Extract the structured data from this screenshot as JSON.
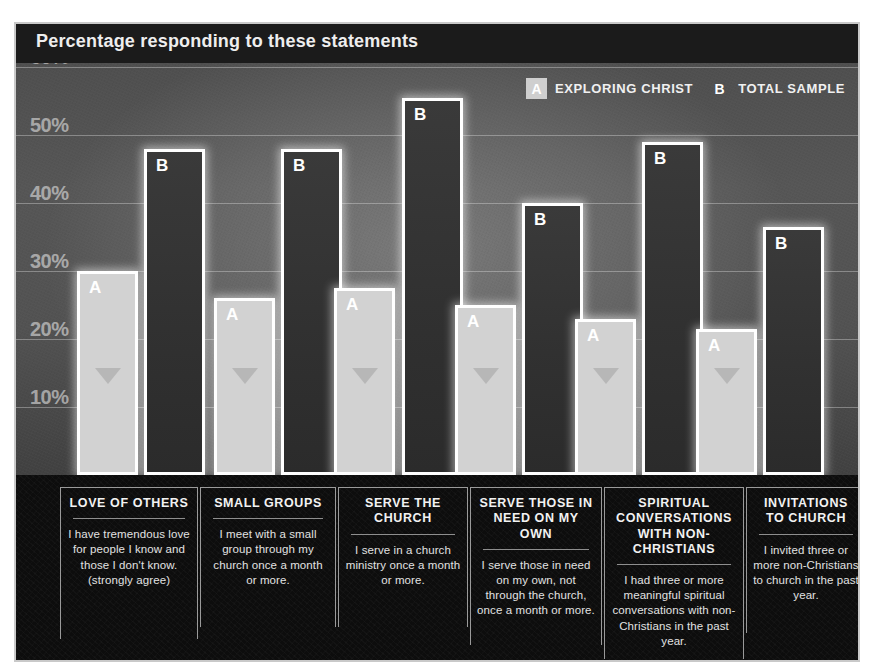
{
  "header": {
    "title": "Percentage responding to these statements"
  },
  "legend": {
    "items": [
      {
        "key": "A",
        "label": "EXPLORING CHRIST"
      },
      {
        "key": "B",
        "label": "TOTAL SAMPLE"
      }
    ]
  },
  "axis": {
    "ticks": [
      "60%",
      "50%",
      "40%",
      "30%",
      "20%",
      "10%"
    ]
  },
  "captions": [
    {
      "title": "LOVE OF OTHERS",
      "body": "I have tremendous love for people I know and those I don't know. (strongly agree)"
    },
    {
      "title": "SMALL GROUPS",
      "body": "I meet with a small group through my church once a month or more."
    },
    {
      "title": "SERVE THE CHURCH",
      "body": "I serve in a church ministry once a month or more."
    },
    {
      "title": "SERVE THOSE IN NEED ON MY OWN",
      "body": "I serve those in need on my own, not through the church, once a month or more."
    },
    {
      "title": "SPIRITUAL CONVERSATIONS WITH NON-CHRISTIANS",
      "body": "I had three or more meaningful spiritual conversations with non-Christians in the past year."
    },
    {
      "title": "INVITATIONS TO CHURCH",
      "body": "I invited three or more non-Christians to church in the past year."
    }
  ],
  "colors": {
    "series_a_fill": "#d2d2d2",
    "series_b_fill": "#313131",
    "bar_outline": "#ffffff",
    "panel_dark": "#0d0d0d",
    "plot_grey": "#515151"
  },
  "chart_data": {
    "type": "bar",
    "title": "Percentage responding to these statements",
    "xlabel": "",
    "ylabel": "",
    "ylim": [
      0,
      60
    ],
    "ytick_values": [
      10,
      20,
      30,
      40,
      50,
      60
    ],
    "ytick_labels": [
      "10%",
      "20%",
      "30%",
      "40%",
      "50%",
      "60%"
    ],
    "grid": true,
    "legend_position": "top-right",
    "categories": [
      "LOVE OF OTHERS",
      "SMALL GROUPS",
      "SERVE THE CHURCH",
      "SERVE THOSE IN NEED ON MY OWN",
      "SPIRITUAL CONVERSATIONS WITH NON-CHRISTIANS",
      "INVITATIONS TO CHURCH"
    ],
    "series": [
      {
        "name": "EXPLORING CHRIST",
        "key": "A",
        "values": [
          30,
          26,
          27.5,
          25,
          23,
          21.5
        ]
      },
      {
        "name": "TOTAL SAMPLE",
        "key": "B",
        "values": [
          48,
          48,
          55.5,
          40,
          49,
          36.5
        ]
      }
    ]
  },
  "_layout": {
    "baseline_y": 453,
    "px_per_percent": 6.8,
    "groups": [
      {
        "a_x": 63,
        "a_w": 61,
        "b_x": 130,
        "b_w": 61
      },
      {
        "a_x": 200,
        "a_w": 61,
        "b_x": 267,
        "b_w": 61
      },
      {
        "a_x": 320,
        "a_w": 61,
        "b_x": 388,
        "b_w": 61
      },
      {
        "a_x": 441,
        "a_w": 61,
        "b_x": 508,
        "b_w": 61
      },
      {
        "a_x": 561,
        "a_w": 61,
        "b_x": 628,
        "b_w": 61
      },
      {
        "a_x": 682,
        "a_w": 61,
        "b_x": 749,
        "b_w": 61
      }
    ],
    "capboxes": [
      {
        "x": 46,
        "w": 138,
        "h": 152
      },
      {
        "x": 186,
        "w": 136,
        "h": 140
      },
      {
        "x": 324,
        "w": 130,
        "h": 140
      },
      {
        "x": 456,
        "w": 132,
        "h": 158
      },
      {
        "x": 590,
        "w": 140,
        "h": 172
      },
      {
        "x": 732,
        "w": 120,
        "h": 146
      }
    ]
  }
}
